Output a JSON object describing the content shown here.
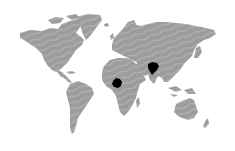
{
  "map": {
    "type": "world-choropleth",
    "land_color": "#9a9a9a",
    "stripe_color": "#b4b4b4",
    "highlight_color": "#000000",
    "background": "#ffffff",
    "highlighted_regions": [
      {
        "name": "Central Africa (Cameroon region)",
        "cx": 117,
        "cy": 83
      },
      {
        "name": "South Asia (Pakistan / Afghanistan region)",
        "cx": 153,
        "cy": 68
      }
    ]
  }
}
